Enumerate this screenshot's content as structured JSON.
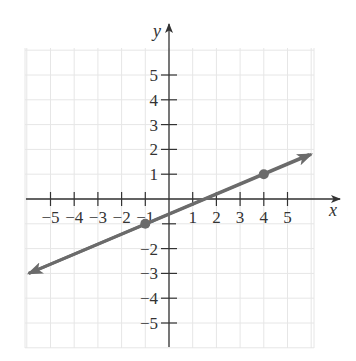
{
  "chart_data": {
    "type": "line",
    "title": "",
    "xlabel": "x",
    "ylabel": "y",
    "xlim": [
      -6,
      6
    ],
    "ylim": [
      -6,
      6
    ],
    "grid": true,
    "x_ticks": [
      -5,
      -4,
      -3,
      -2,
      -1,
      1,
      2,
      3,
      4,
      5
    ],
    "y_ticks": [
      5,
      4,
      3,
      2,
      1,
      -2,
      -3,
      -4,
      -5
    ],
    "x_tick_labels": [
      "−5",
      "−4",
      "−3",
      "−2",
      "−1",
      "1",
      "2",
      "3",
      "4",
      "5"
    ],
    "y_tick_labels": [
      "5",
      "4",
      "3",
      "2",
      "1",
      "−2",
      "−3",
      "−4",
      "−5"
    ],
    "series": [
      {
        "name": "line",
        "equation": "y = 0.4x - 0.6",
        "slope": 0.4,
        "intercept": -0.6,
        "endpoints": [
          [
            -6,
            -3.0
          ],
          [
            6,
            1.8
          ]
        ],
        "arrows_both_ends": true,
        "color": "#6b6b6b"
      }
    ],
    "points": [
      {
        "x": -1,
        "y": -1
      },
      {
        "x": 4,
        "y": 1
      }
    ]
  },
  "colors": {
    "line": "#6b6b6b",
    "axis": "#333333",
    "grid": "#e6e6e6"
  }
}
